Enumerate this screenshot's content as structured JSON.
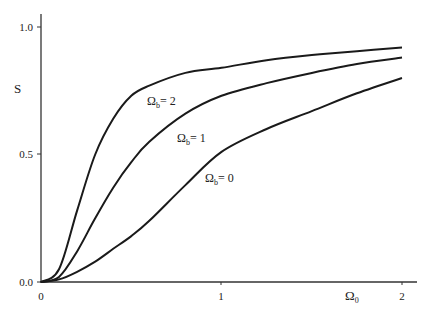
{
  "chart_data": {
    "type": "line",
    "title": "",
    "xlabel": "Ω0",
    "ylabel": "S",
    "xlim": [
      0,
      2
    ],
    "ylim": [
      0,
      1
    ],
    "grid": false,
    "legend": "inline curve labels",
    "x_ticks": [
      "0",
      "1",
      "2"
    ],
    "y_ticks": [
      "0.0",
      "0.5",
      "1.0"
    ],
    "x": [
      0,
      0.1,
      0.2,
      0.3,
      0.4,
      0.5,
      0.6,
      0.8,
      1.0,
      1.25,
      1.5,
      1.75,
      2.0
    ],
    "series": [
      {
        "name": "Ωb = 2",
        "label_main": "Ω",
        "label_sub": "b",
        "label_rest": "= 2",
        "values": [
          0,
          0.05,
          0.28,
          0.5,
          0.64,
          0.73,
          0.77,
          0.82,
          0.84,
          0.87,
          0.89,
          0.905,
          0.92
        ]
      },
      {
        "name": "Ωb = 1",
        "label_main": "Ω",
        "label_sub": "b",
        "label_rest": "= 1",
        "values": [
          0,
          0.02,
          0.12,
          0.25,
          0.37,
          0.47,
          0.55,
          0.66,
          0.73,
          0.78,
          0.82,
          0.855,
          0.88
        ]
      },
      {
        "name": "Ωb = 0",
        "label_main": "Ω",
        "label_sub": "b",
        "label_rest": "= 0",
        "values": [
          0,
          0.01,
          0.04,
          0.08,
          0.13,
          0.18,
          0.24,
          0.38,
          0.51,
          0.6,
          0.67,
          0.74,
          0.8
        ]
      }
    ]
  },
  "axes": {
    "y_label": "S",
    "x_label_main": "Ω",
    "x_label_sub": "0"
  }
}
